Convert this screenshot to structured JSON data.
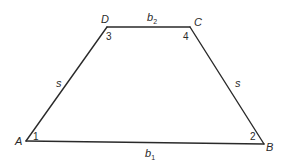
{
  "figure": {
    "shape": "isosceles trapezoid",
    "vertices": {
      "A": "A",
      "B": "B",
      "C": "C",
      "D": "D"
    },
    "sides": {
      "bottom_base": {
        "label": "b",
        "subscript": "1"
      },
      "top_base": {
        "label": "b",
        "subscript": "2"
      },
      "left_leg": {
        "label": "s"
      },
      "right_leg": {
        "label": "s"
      }
    },
    "angles": {
      "at_A": "1",
      "at_B": "2",
      "at_D": "3",
      "at_C": "4"
    }
  }
}
